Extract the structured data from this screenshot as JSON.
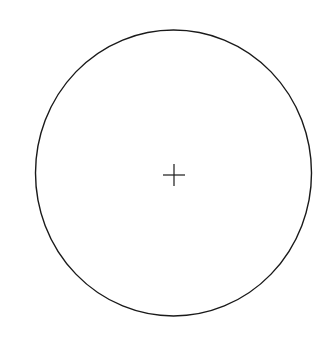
{
  "diagram": {
    "background_color": "#ffffff",
    "stroke_color": "#1a1a1a",
    "circle": {
      "cx": 173.5,
      "cy": 173,
      "rx": 138,
      "ry": 143,
      "stroke_width": 1.4
    },
    "center_mark": {
      "shape": "plus",
      "cx": 174,
      "cy": 175,
      "half_size": 11,
      "stroke_width": 1.2
    }
  }
}
